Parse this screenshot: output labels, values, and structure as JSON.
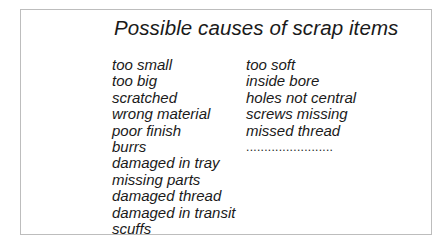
{
  "title": "Possible causes of scrap items",
  "columns": [
    {
      "items": [
        "too small",
        "too big",
        "scratched",
        "wrong material",
        "poor finish",
        "burrs",
        "damaged in tray",
        "missing parts",
        "damaged thread",
        "damaged in transit",
        "scuffs"
      ]
    },
    {
      "items": [
        "too soft",
        "inside bore",
        "holes not central",
        "screws missing",
        "missed thread",
        "........................"
      ]
    }
  ]
}
